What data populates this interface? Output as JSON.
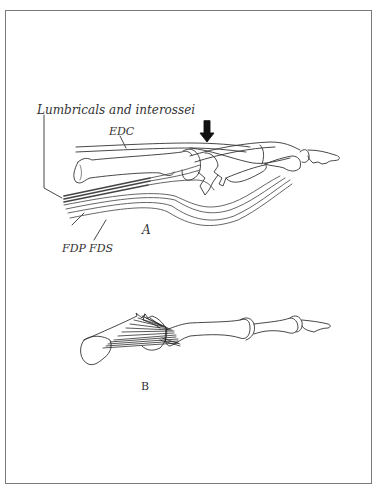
{
  "figure": {
    "panel_a": {
      "label": "A",
      "annotations": {
        "lumbricals": "Lumbricals and interossei",
        "edc": "EDC",
        "fdp": "FDP",
        "fds": "FDS"
      },
      "arrow": "down-arrow"
    },
    "panel_b": {
      "label": "B"
    },
    "colors": {
      "frame": "#7a7a7a",
      "ink": "#222222",
      "background": "#ffffff"
    }
  }
}
